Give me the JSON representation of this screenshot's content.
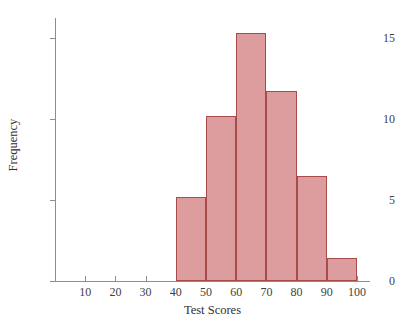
{
  "chart_data": {
    "type": "bar",
    "title": "",
    "subtitle": "",
    "xlabel": "Test Scores",
    "ylabel": "Frequency",
    "categories": [
      "40-50",
      "50-60",
      "60-70",
      "70-80",
      "80-90",
      "90-100"
    ],
    "bin_edges": [
      40,
      50,
      60,
      70,
      80,
      90,
      100
    ],
    "values": [
      5.2,
      10.2,
      15.3,
      11.7,
      6.5,
      1.4
    ],
    "xlim": [
      0,
      100
    ],
    "ylim": [
      0,
      16.3
    ],
    "xticks": [
      10,
      20,
      30,
      40,
      50,
      60,
      70,
      80,
      90,
      100
    ],
    "yticks": [
      0,
      5,
      10,
      15
    ],
    "xtick_labels": [
      "10",
      "20",
      "30",
      "40",
      "50",
      "60",
      "70",
      "80",
      "90",
      "100"
    ],
    "ytick_labels": [
      "0",
      "5",
      "10",
      "15"
    ],
    "grid": false,
    "legend": false,
    "legend_position": "none",
    "bar_fill_color": "#dd9d9e",
    "bar_border_color": "#a84b4b",
    "axis_color": "#8d8d8d",
    "annotations": []
  }
}
